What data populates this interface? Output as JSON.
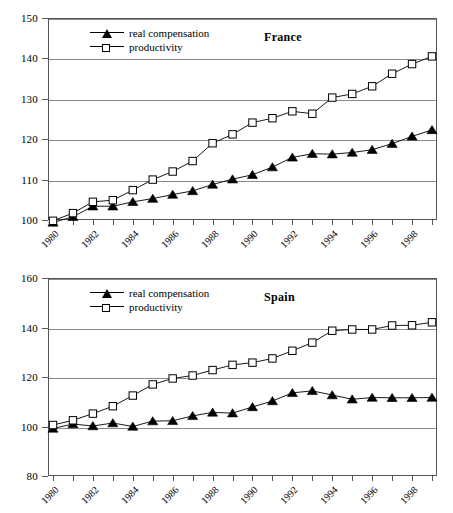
{
  "figure": {
    "panels": [
      "france",
      "spain"
    ]
  },
  "legend": {
    "items": [
      {
        "label": "real compensation",
        "marker": "filled-triangle",
        "color": "#000000"
      },
      {
        "label": "productivity",
        "marker": "open-square",
        "color": "#000000"
      }
    ]
  },
  "chart_data": [
    {
      "type": "line",
      "title": "France",
      "xlabel": "",
      "ylabel": "",
      "ylim": [
        100,
        150
      ],
      "yticks": [
        100,
        110,
        120,
        130,
        140,
        150
      ],
      "xlim": [
        1980,
        1999
      ],
      "x": [
        1980,
        1981,
        1982,
        1983,
        1984,
        1985,
        1986,
        1987,
        1988,
        1989,
        1990,
        1991,
        1992,
        1993,
        1994,
        1995,
        1996,
        1997,
        1998,
        1999
      ],
      "xticklabels": [
        "1980",
        "",
        "1982",
        "",
        "1984",
        "",
        "1986",
        "",
        "1988",
        "",
        "1990",
        "",
        "1992",
        "",
        "1994",
        "",
        "1996",
        "",
        "1998",
        ""
      ],
      "grid": "horizontal",
      "legend_position": "upper-left",
      "series": [
        {
          "name": "real compensation",
          "marker": "filled-triangle",
          "values": [
            99.4,
            100.8,
            103.4,
            103.4,
            104.5,
            105.3,
            106.3,
            107.2,
            108.8,
            110.1,
            111.2,
            113.1,
            115.5,
            116.4,
            116.3,
            116.7,
            117.4,
            118.9,
            120.7,
            122.3
          ]
        },
        {
          "name": "productivity",
          "marker": "open-square",
          "values": [
            99.8,
            101.7,
            104.5,
            104.9,
            107.4,
            110.0,
            112.0,
            114.6,
            119.0,
            121.2,
            124.1,
            125.2,
            126.9,
            126.3,
            130.3,
            131.2,
            133.1,
            136.2,
            138.6,
            140.5
          ]
        }
      ]
    },
    {
      "type": "line",
      "title": "Spain",
      "xlabel": "",
      "ylabel": "",
      "ylim": [
        80,
        160
      ],
      "yticks": [
        80,
        100,
        120,
        140,
        160
      ],
      "xlim": [
        1980,
        1999
      ],
      "x": [
        1980,
        1981,
        1982,
        1983,
        1984,
        1985,
        1986,
        1987,
        1988,
        1989,
        1990,
        1991,
        1992,
        1993,
        1994,
        1995,
        1996,
        1997,
        1998,
        1999
      ],
      "xticklabels": [
        "1980",
        "",
        "1982",
        "",
        "1984",
        "",
        "1986",
        "",
        "1988",
        "",
        "1990",
        "",
        "1992",
        "",
        "1994",
        "",
        "1996",
        "",
        "1998",
        ""
      ],
      "grid": "horizontal",
      "legend_position": "upper-left",
      "series": [
        {
          "name": "real compensation",
          "marker": "filled-triangle",
          "values": [
            99.2,
            101.0,
            100.2,
            101.4,
            100.0,
            102.2,
            102.3,
            104.3,
            105.7,
            105.4,
            107.9,
            110.3,
            113.6,
            114.4,
            112.7,
            111.0,
            111.7,
            111.6,
            111.6,
            111.7
          ]
        },
        {
          "name": "productivity",
          "marker": "open-square",
          "values": [
            100.6,
            102.5,
            105.2,
            108.2,
            112.5,
            117.0,
            119.4,
            120.6,
            122.8,
            124.9,
            125.8,
            127.5,
            130.6,
            133.9,
            138.7,
            139.2,
            139.2,
            140.8,
            140.9,
            142.1
          ]
        }
      ]
    }
  ]
}
